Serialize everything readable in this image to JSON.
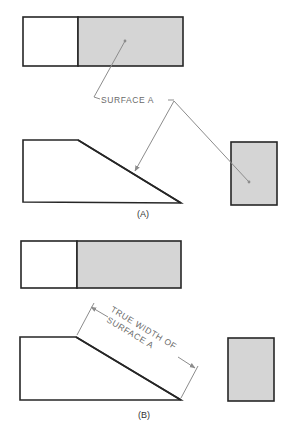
{
  "figure": {
    "panel_a": {
      "caption": "(A)",
      "leader_label": "SURFACE A",
      "views": [
        "top-view",
        "front-view",
        "side-view"
      ]
    },
    "panel_b": {
      "caption": "(B)",
      "dimension_label_line1": "TRUE WIDTH OF",
      "dimension_label_line2": "SURFACE A",
      "views": [
        "top-view",
        "front-view",
        "side-view"
      ]
    },
    "colors": {
      "outline": "#262626",
      "surface_fill": "#d5d5d5",
      "leader": "#8c8c8c"
    }
  }
}
